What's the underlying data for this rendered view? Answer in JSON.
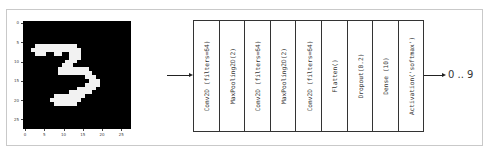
{
  "figure": {
    "input_image": {
      "description": "MNIST handwritten digit",
      "digit_shown": "3",
      "grid_size": 28,
      "y_ticks": [
        "0",
        "5",
        "10",
        "15",
        "20",
        "25"
      ],
      "x_ticks": [
        "0",
        "5",
        "10",
        "15",
        "20",
        "25"
      ],
      "pixels_on": [
        [
          6,
          3
        ],
        [
          6,
          4
        ],
        [
          6,
          5
        ],
        [
          6,
          6
        ],
        [
          6,
          7
        ],
        [
          6,
          8
        ],
        [
          6,
          9
        ],
        [
          6,
          10
        ],
        [
          6,
          11
        ],
        [
          6,
          12
        ],
        [
          6,
          13
        ],
        [
          7,
          2
        ],
        [
          7,
          3
        ],
        [
          7,
          4
        ],
        [
          7,
          5
        ],
        [
          7,
          6
        ],
        [
          7,
          7
        ],
        [
          7,
          8
        ],
        [
          7,
          9
        ],
        [
          7,
          10
        ],
        [
          7,
          11
        ],
        [
          7,
          12
        ],
        [
          7,
          13
        ],
        [
          7,
          14
        ],
        [
          8,
          3
        ],
        [
          8,
          4
        ],
        [
          8,
          5
        ],
        [
          8,
          8
        ],
        [
          8,
          9
        ],
        [
          8,
          12
        ],
        [
          8,
          13
        ],
        [
          8,
          14
        ],
        [
          9,
          12
        ],
        [
          9,
          13
        ],
        [
          9,
          14
        ],
        [
          10,
          11
        ],
        [
          10,
          12
        ],
        [
          10,
          13
        ],
        [
          11,
          10
        ],
        [
          11,
          11
        ],
        [
          11,
          12
        ],
        [
          12,
          9
        ],
        [
          12,
          10
        ],
        [
          12,
          11
        ],
        [
          12,
          12
        ],
        [
          12,
          13
        ],
        [
          12,
          14
        ],
        [
          12,
          15
        ],
        [
          12,
          16
        ],
        [
          13,
          9
        ],
        [
          13,
          10
        ],
        [
          13,
          11
        ],
        [
          13,
          12
        ],
        [
          13,
          13
        ],
        [
          13,
          14
        ],
        [
          13,
          15
        ],
        [
          13,
          16
        ],
        [
          13,
          17
        ],
        [
          14,
          16
        ],
        [
          14,
          17
        ],
        [
          14,
          18
        ],
        [
          15,
          17
        ],
        [
          15,
          18
        ],
        [
          15,
          19
        ],
        [
          16,
          16
        ],
        [
          16,
          17
        ],
        [
          16,
          18
        ],
        [
          16,
          19
        ],
        [
          17,
          14
        ],
        [
          17,
          15
        ],
        [
          17,
          16
        ],
        [
          17,
          17
        ],
        [
          17,
          18
        ],
        [
          18,
          12
        ],
        [
          18,
          13
        ],
        [
          18,
          14
        ],
        [
          18,
          15
        ],
        [
          18,
          16
        ],
        [
          18,
          17
        ],
        [
          19,
          8
        ],
        [
          19,
          9
        ],
        [
          19,
          10
        ],
        [
          19,
          11
        ],
        [
          19,
          12
        ],
        [
          19,
          13
        ],
        [
          19,
          14
        ],
        [
          19,
          15
        ],
        [
          20,
          7
        ],
        [
          20,
          8
        ],
        [
          20,
          9
        ],
        [
          20,
          10
        ],
        [
          20,
          11
        ],
        [
          20,
          12
        ],
        [
          20,
          13
        ],
        [
          20,
          14
        ],
        [
          21,
          8
        ],
        [
          21,
          9
        ],
        [
          21,
          10
        ],
        [
          21,
          11
        ],
        [
          21,
          12
        ],
        [
          21,
          13
        ]
      ]
    },
    "layers": [
      {
        "label": "Conv2D (filters=64)"
      },
      {
        "label": "MaxPooling2D(2)"
      },
      {
        "label": "Conv2D (filters=64)"
      },
      {
        "label": "MaxPooling2D(2)"
      },
      {
        "label": "Conv2D (filters=64)"
      },
      {
        "label": "Flatten()"
      },
      {
        "label": "Dropout(0.2)"
      },
      {
        "label": "Dense (10)"
      },
      {
        "label": "Activation('softmax')"
      }
    ],
    "output_label": "0 .. 9"
  }
}
